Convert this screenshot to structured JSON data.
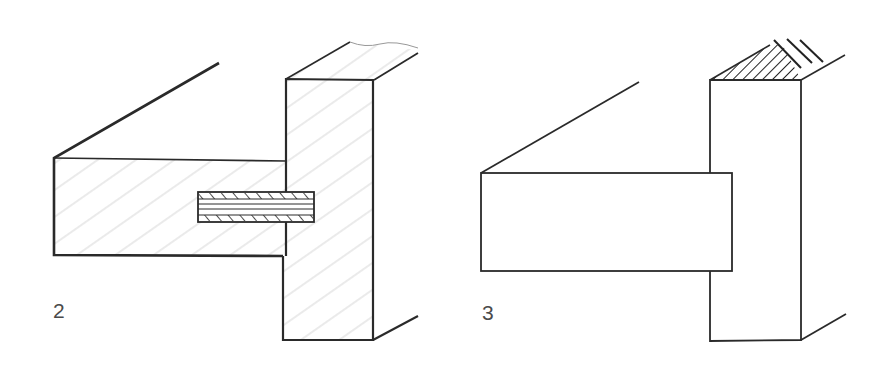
{
  "figures": [
    {
      "number": "2",
      "description": "Rail joined to post with a spline / loose tenon, shown in section with wood-grain hatching"
    },
    {
      "number": "3",
      "description": "Rail butting into post, exterior view with hatched end grain on post top"
    }
  ],
  "colors": {
    "line": "#2a2a2a",
    "grain": "#b8b8b8",
    "label": "#4a4a4a",
    "background": "#ffffff"
  }
}
